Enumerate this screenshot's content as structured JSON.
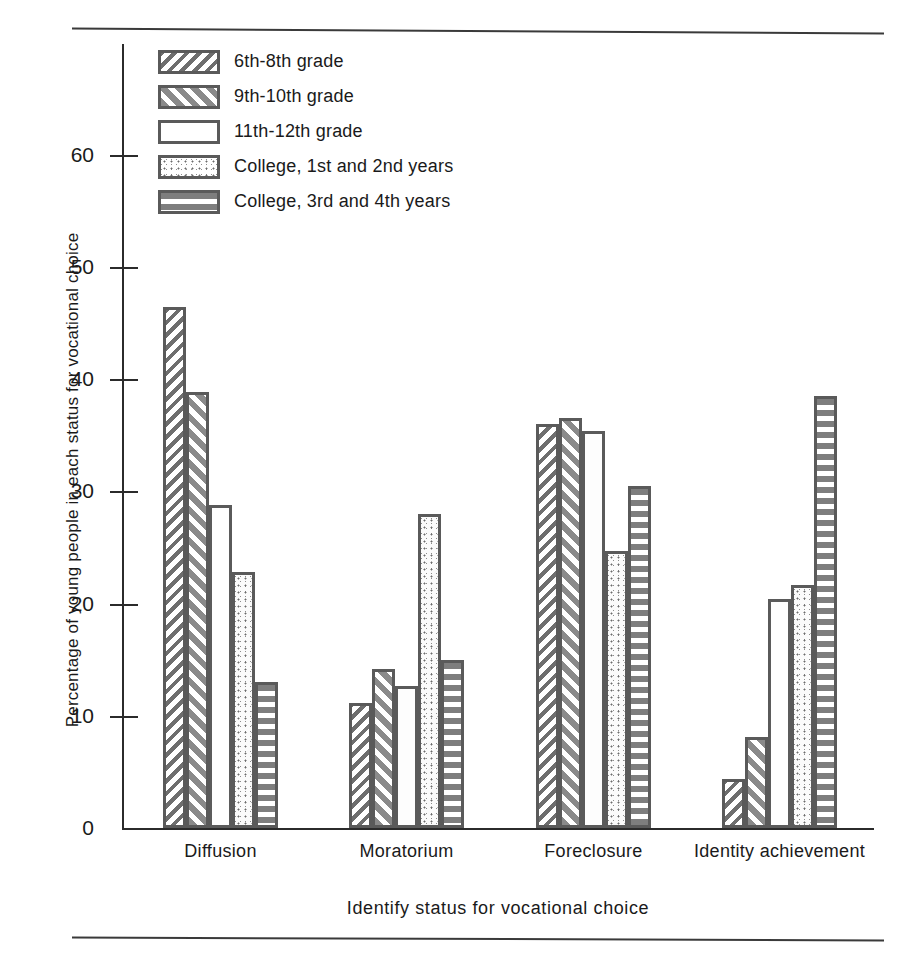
{
  "figure": {
    "y_axis_title": "Percentage of young people in each status for vocational choice",
    "x_axis_title": "Identify status for vocational choice"
  },
  "legend": {
    "items": [
      {
        "label": "6th-8th grade",
        "pattern": "diagonal-stripes-white",
        "color": "#6e6e6e"
      },
      {
        "label": "9th-10th grade",
        "pattern": "diagonal-stripes-gray",
        "color": "#8a8a8a"
      },
      {
        "label": "11th-12th grade",
        "pattern": "plain-white",
        "color": "#fdfdfd"
      },
      {
        "label": "College, 1st and 2nd years",
        "pattern": "stipple",
        "color": "#6b6b6b"
      },
      {
        "label": "College, 3rd and 4th years",
        "pattern": "horizontal-stripes",
        "color": "#7e7e7e"
      }
    ]
  },
  "axis": {
    "y_ticks": [
      "10",
      "20",
      "30",
      "40",
      "50",
      "60"
    ],
    "x_groups": [
      "Diffusion",
      "Moratorium",
      "Foreclosure",
      "Identity achievement"
    ]
  },
  "chart_data": {
    "type": "bar",
    "title": "",
    "xlabel": "Identify status for vocational choice",
    "ylabel": "Percentage of young people in each status for vocational choice",
    "categories": [
      "Diffusion",
      "Moratorium",
      "Foreclosure",
      "Identity achievement"
    ],
    "series": [
      {
        "name": "6th-8th grade",
        "values": [
          46.4,
          11.1,
          36.0,
          4.4
        ]
      },
      {
        "name": "9th-10th grade",
        "values": [
          38.9,
          14.2,
          36.5,
          8.1
        ]
      },
      {
        "name": "11th-12th grade",
        "values": [
          28.8,
          12.7,
          35.4,
          20.4
        ]
      },
      {
        "name": "College, 1st and 2nd years",
        "values": [
          22.8,
          28.0,
          24.7,
          21.7
        ]
      },
      {
        "name": "College, 3rd and 4th years",
        "values": [
          13.0,
          15.0,
          30.5,
          38.5
        ]
      }
    ],
    "ylim": [
      0,
      64
    ],
    "yticks": [
      10,
      20,
      30,
      40,
      50,
      60
    ],
    "grid": false,
    "legend_position": "upper-left"
  }
}
